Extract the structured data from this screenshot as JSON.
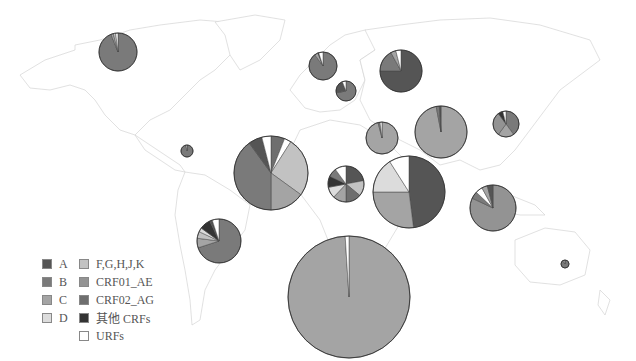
{
  "legend": {
    "items": [
      {
        "key": "A",
        "label": "A",
        "color": "#555555"
      },
      {
        "key": "B",
        "label": "B",
        "color": "#7a7a7a"
      },
      {
        "key": "C",
        "label": "C",
        "color": "#a4a4a4"
      },
      {
        "key": "D",
        "label": "D",
        "color": "#dcdcdc"
      },
      {
        "key": "FGHJK",
        "label": "F,G,H,J,K",
        "color": "#c2c2c2"
      },
      {
        "key": "CRF01_AE",
        "label": "CRF01_AE",
        "color": "#939393"
      },
      {
        "key": "CRF02_AG",
        "label": "CRF02_AG",
        "color": "#6e6e6e"
      },
      {
        "key": "OTHER_CRF",
        "label": "其他 CRFs",
        "color": "#333333"
      },
      {
        "key": "URF",
        "label": "URFs",
        "color": "#ffffff"
      }
    ]
  },
  "pies": [
    {
      "name": "north-america",
      "cx": 118,
      "cy": 52,
      "r": 19,
      "slices": [
        [
          "B",
          94
        ],
        [
          "C",
          2
        ],
        [
          "FGHJK",
          2
        ],
        [
          "URF",
          2
        ]
      ]
    },
    {
      "name": "caribbean",
      "cx": 187,
      "cy": 151,
      "r": 6,
      "slices": [
        [
          "B",
          97
        ],
        [
          "URF",
          3
        ]
      ]
    },
    {
      "name": "south-america",
      "cx": 219,
      "cy": 241,
      "r": 22,
      "slices": [
        [
          "B",
          70
        ],
        [
          "C",
          7
        ],
        [
          "FGHJK",
          5
        ],
        [
          "D",
          3
        ],
        [
          "OTHER_CRF",
          8
        ],
        [
          "A",
          2
        ],
        [
          "URF",
          5
        ]
      ]
    },
    {
      "name": "western-europe",
      "cx": 323,
      "cy": 66,
      "r": 14,
      "slices": [
        [
          "B",
          90
        ],
        [
          "C",
          4
        ],
        [
          "OTHER_CRF",
          1
        ],
        [
          "URF",
          5
        ]
      ]
    },
    {
      "name": "central-europe",
      "cx": 346,
      "cy": 91,
      "r": 10,
      "slices": [
        [
          "B",
          72
        ],
        [
          "A",
          22
        ],
        [
          "URF",
          6
        ]
      ]
    },
    {
      "name": "eastern-europe",
      "cx": 401,
      "cy": 71,
      "r": 21,
      "slices": [
        [
          "A",
          75
        ],
        [
          "B",
          17
        ],
        [
          "C",
          4
        ],
        [
          "URF",
          4
        ]
      ]
    },
    {
      "name": "north-africa",
      "cx": 271,
      "cy": 173,
      "r": 37,
      "slices": [
        [
          "CRF02_AG",
          6
        ],
        [
          "URF",
          3
        ],
        [
          "FGHJK",
          26
        ],
        [
          "C",
          15
        ],
        [
          "B",
          40
        ],
        [
          "A",
          6
        ],
        [
          "URF",
          4
        ]
      ]
    },
    {
      "name": "middle-east",
      "cx": 382,
      "cy": 138,
      "r": 16,
      "slices": [
        [
          "C",
          96
        ],
        [
          "B",
          2
        ],
        [
          "URF",
          2
        ]
      ]
    },
    {
      "name": "central-africa",
      "cx": 346,
      "cy": 184,
      "r": 18,
      "slices": [
        [
          "A",
          22
        ],
        [
          "FGHJK",
          14
        ],
        [
          "CRF02_AG",
          14
        ],
        [
          "C",
          12
        ],
        [
          "D",
          10
        ],
        [
          "OTHER_CRF",
          10
        ],
        [
          "B",
          8
        ],
        [
          "URF",
          10
        ]
      ]
    },
    {
      "name": "east-africa",
      "cx": 409,
      "cy": 192,
      "r": 36,
      "slices": [
        [
          "A",
          48
        ],
        [
          "C",
          27
        ],
        [
          "D",
          16
        ],
        [
          "URF",
          9
        ]
      ]
    },
    {
      "name": "south-asia",
      "cx": 441,
      "cy": 132,
      "r": 26,
      "slices": [
        [
          "C",
          97
        ],
        [
          "B",
          2
        ],
        [
          "A",
          1
        ]
      ]
    },
    {
      "name": "east-asia",
      "cx": 506,
      "cy": 124,
      "r": 13,
      "slices": [
        [
          "B",
          40
        ],
        [
          "C",
          20
        ],
        [
          "CRF01_AE",
          30
        ],
        [
          "OTHER_CRF",
          6
        ],
        [
          "URF",
          4
        ]
      ]
    },
    {
      "name": "southeast-asia",
      "cx": 493,
      "cy": 208,
      "r": 23,
      "slices": [
        [
          "CRF01_AE",
          82
        ],
        [
          "B",
          5
        ],
        [
          "URF",
          5
        ],
        [
          "C",
          4
        ],
        [
          "A",
          4
        ]
      ]
    },
    {
      "name": "oceania",
      "cx": 565,
      "cy": 264,
      "r": 4,
      "slices": [
        [
          "B",
          90
        ],
        [
          "C",
          10
        ]
      ]
    },
    {
      "name": "southern-africa",
      "cx": 349,
      "cy": 297,
      "r": 61,
      "slices": [
        [
          "C",
          99
        ],
        [
          "URF",
          1
        ]
      ]
    }
  ]
}
